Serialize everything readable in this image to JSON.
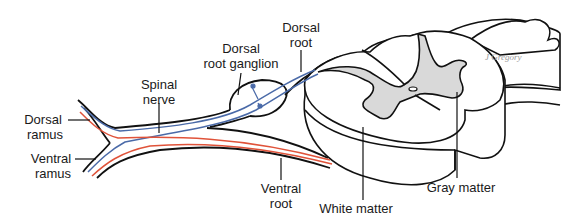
{
  "diagram": {
    "labels": {
      "dorsal_root": [
        "Dorsal",
        "root"
      ],
      "dorsal_root_ganglion": [
        "Dorsal",
        "root ganglion"
      ],
      "spinal_nerve": [
        "Spinal",
        "nerve"
      ],
      "dorsal_ramus": [
        "Dorsal",
        "ramus"
      ],
      "ventral_ramus": [
        "Ventral",
        "ramus"
      ],
      "ventral_root": [
        "Ventral",
        "root"
      ],
      "white_matter": "White matter",
      "gray_matter": "Gray matter"
    },
    "signature": "J Gregory",
    "colors": {
      "outline": "#111111",
      "sensory_fiber": "#4a6aa8",
      "motor_fiber": "#e0533a",
      "gray_matter": "#d9d9d9",
      "white_matter": "#ffffff"
    }
  }
}
